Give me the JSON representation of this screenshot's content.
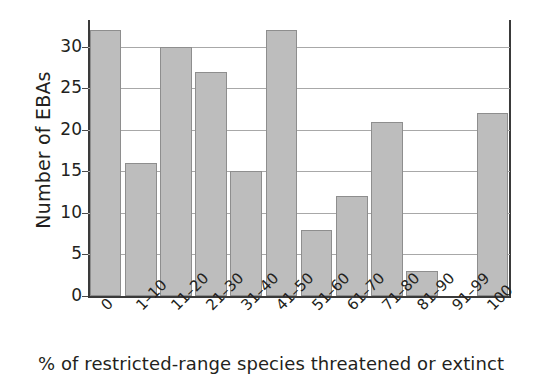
{
  "chart_data": {
    "type": "bar",
    "title": "",
    "xlabel": "% of restricted-range species threatened or extinct",
    "ylabel": "Number of EBAs",
    "categories": [
      "0",
      "1–10",
      "11–20",
      "21–30",
      "31–40",
      "41–50",
      "51–60",
      "61–70",
      "71–80",
      "81–90",
      "91–99",
      "100"
    ],
    "values": [
      32,
      16,
      30,
      27,
      15,
      32,
      8,
      12,
      21,
      3,
      0,
      22
    ],
    "ylim": [
      0,
      33
    ],
    "yticks": [
      0,
      5,
      10,
      15,
      20,
      25,
      30
    ],
    "ytick_labels": [
      "0",
      "5",
      "10",
      "15",
      "20",
      "25",
      "30"
    ],
    "grid": true,
    "grid_axis": "y",
    "legend": "none",
    "bar_color": "#bdbdbd",
    "bar_edge_color": "#8e8e8e",
    "axis_color": "#3a3a3a",
    "grid_color": "#a8a8a8",
    "background_color": "#ffffff",
    "xtick_rotation": -45
  }
}
